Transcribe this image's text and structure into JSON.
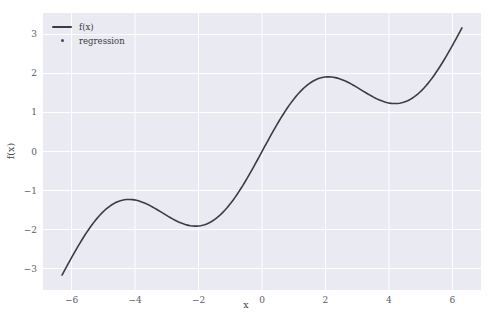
{
  "figure": {
    "background": "#ffffff",
    "axes_facecolor": "#eaeaf2",
    "grid_color": "#ffffff",
    "tick_color": "#5b5b62",
    "line_color": "#3b3b42"
  },
  "legend": {
    "position": "upper left",
    "entries": [
      {
        "label": "f(x)",
        "marker": "line",
        "color": "#3b3b42",
        "key_name": "legend-key-line"
      },
      {
        "label": "regression",
        "marker": "dot",
        "color": "#4a4a52",
        "key_name": "legend-key-dot"
      }
    ]
  },
  "caption": {
    "text": ""
  },
  "chart_data": {
    "type": "line",
    "title": "",
    "xlabel": "x",
    "ylabel": "f(x)",
    "xlim": [
      -6.9,
      6.9
    ],
    "ylim": [
      -3.55,
      3.55
    ],
    "grid": true,
    "legend_position": "upper left",
    "xticks": [
      -6,
      -4,
      -2,
      0,
      2,
      4,
      6
    ],
    "xticklabels": [
      "−6",
      "−4",
      "−2",
      "0",
      "2",
      "4",
      "6"
    ],
    "yticks": [
      -3,
      -2,
      -1,
      0,
      1,
      2,
      3
    ],
    "yticklabels": [
      "−3",
      "−2",
      "−1",
      "0",
      "1",
      "2",
      "3"
    ],
    "series": [
      {
        "name": "f(x)",
        "type": "line",
        "color": "#3b3b42",
        "linewidth": 1.6,
        "expression": "x/2 + sin(x)",
        "x_start": -6.3,
        "x_end": 6.3,
        "n_points": 200,
        "x": [
          -6.3,
          -6.0,
          -5.7,
          -5.4,
          -5.1,
          -4.8,
          -4.5,
          -4.2,
          -3.9,
          -3.6,
          -3.3,
          -3.0,
          -2.7,
          -2.4,
          -2.1,
          -1.8,
          -1.5,
          -1.2,
          -0.9,
          -0.6,
          -0.3,
          0.0,
          0.3,
          0.6,
          0.9,
          1.2,
          1.5,
          1.8,
          2.1,
          2.4,
          2.7,
          3.0,
          3.3,
          3.6,
          3.9,
          4.2,
          4.5,
          4.8,
          5.1,
          5.4,
          5.7,
          6.0,
          6.3
        ],
        "y": [
          -3.13,
          -2.72,
          -2.32,
          -1.93,
          -1.62,
          -1.4,
          -1.27,
          -1.23,
          -1.27,
          -1.36,
          -1.49,
          -1.64,
          -1.78,
          -1.88,
          -1.91,
          -1.87,
          -1.75,
          -1.53,
          -1.23,
          -0.86,
          -0.45,
          0.0,
          0.45,
          0.86,
          1.23,
          1.53,
          1.75,
          1.87,
          1.91,
          1.88,
          1.78,
          1.64,
          1.49,
          1.36,
          1.27,
          1.23,
          1.27,
          1.4,
          1.62,
          1.93,
          2.32,
          2.72,
          3.13
        ],
        "features": {
          "local_max_left": {
            "x": -4.2,
            "y": -1.23
          },
          "local_min_left": {
            "x": -2.1,
            "y": -1.91
          },
          "local_max_right": {
            "x": 2.1,
            "y": 1.91
          },
          "local_min_right": {
            "x": 4.2,
            "y": 1.23
          },
          "endpoint_left": {
            "x": -6.3,
            "y": -3.13
          },
          "endpoint_right": {
            "x": 6.3,
            "y": 3.13
          },
          "zero_crossing": {
            "x": 0.0,
            "y": 0.0
          }
        }
      },
      {
        "name": "regression",
        "type": "scatter",
        "color": "#4a4a52",
        "marker_size": 2,
        "note": "overlaps f(x) curve",
        "x": [],
        "y": []
      }
    ]
  }
}
